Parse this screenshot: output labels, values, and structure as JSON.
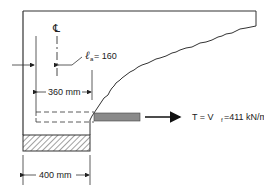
{
  "diagram": {
    "type": "structural-bracket-detail",
    "labels": {
      "centerline_symbol": "℄",
      "la_symbol": "ℓ",
      "la_subscript": "a",
      "la_value": " = 160",
      "dim_360": "360 mm",
      "dim_400": "400 mm",
      "tension_prefix": "T = V",
      "tension_subscript": "f",
      "tension_value": " =411 kN/m"
    },
    "colors": {
      "line": "#333333",
      "bar_fill": "#8a8a8a",
      "hatch": "#444444",
      "background": "#ffffff"
    }
  }
}
